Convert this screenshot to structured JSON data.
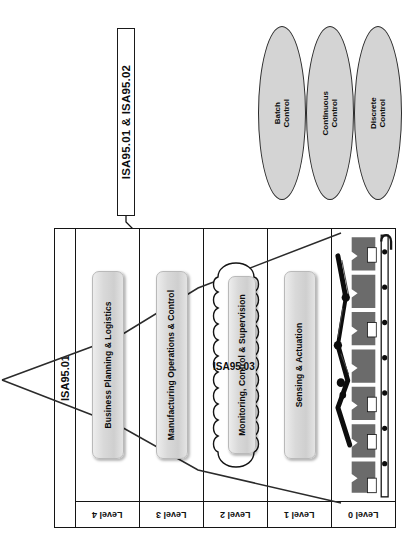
{
  "diagram": {
    "standards_callout": {
      "label": "ISA95.01 & ISA95.02"
    },
    "side_label": {
      "label": "ISA95.01"
    },
    "cloud": {
      "label": "ISA95.03"
    },
    "control_types": [
      {
        "name": "batch-control",
        "line1": "Batch",
        "line2": "Control"
      },
      {
        "name": "continuous-control",
        "line1": "Continuous",
        "line2": "Control"
      },
      {
        "name": "discrete-control",
        "line1": "Discrete",
        "line2": "Control"
      }
    ],
    "levels": [
      {
        "level_label": "Level 4",
        "function": "Business Planning & Logistics",
        "has_cloud": false,
        "has_plant": false
      },
      {
        "level_label": "Level 3",
        "function": "Manufacturing Operations & Control",
        "has_cloud": false,
        "has_plant": false
      },
      {
        "level_label": "Level 2",
        "function": "Monitoring, Control & Supervision",
        "has_cloud": true,
        "has_plant": false
      },
      {
        "level_label": "Level 1",
        "function": "Sensing & Actuation",
        "has_cloud": false,
        "has_plant": false
      },
      {
        "level_label": "Level 0",
        "function": "",
        "has_cloud": false,
        "has_plant": true
      }
    ],
    "colors": {
      "line": "#141414",
      "ellipse_fill": "#d4d4d4",
      "box_fill": "#d9d9d9",
      "plant_fill": "#6b6b6b",
      "background": "#ffffff"
    }
  }
}
